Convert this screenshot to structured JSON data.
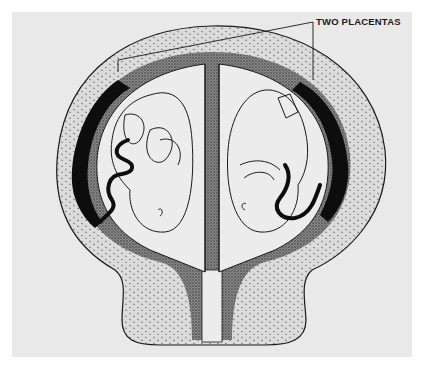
{
  "diagram": {
    "annotations": [
      {
        "id": "placentas",
        "label": "TWO PLACENTAS"
      }
    ],
    "elements": [
      "uterine wall",
      "decidua",
      "left placenta",
      "right placenta",
      "left amniotic sac",
      "right amniotic sac",
      "left fetus",
      "right fetus",
      "dividing membrane",
      "cervix"
    ],
    "colors": {
      "background": "#e9e9e9",
      "wall_fill": "#d8d8d8",
      "decidua": "#6a6a6a",
      "placenta": "#0d0d0d",
      "sac_fill": "#ececec",
      "line": "#1a1a1a"
    }
  }
}
